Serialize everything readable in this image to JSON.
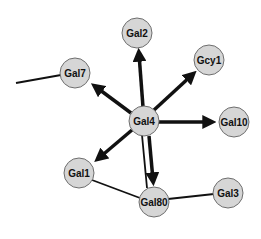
{
  "diagram": {
    "type": "gene-regulatory-network",
    "nodes": [
      {
        "id": "Gal4",
        "label": "Gal4",
        "x": 144,
        "y": 121
      },
      {
        "id": "Gal2",
        "label": "Gal2",
        "x": 137,
        "y": 33
      },
      {
        "id": "Gcy1",
        "label": "Gcy1",
        "x": 209,
        "y": 60
      },
      {
        "id": "Gal7",
        "label": "Gal7",
        "x": 75,
        "y": 73
      },
      {
        "id": "Gal10",
        "label": "Gal10",
        "x": 234,
        "y": 122
      },
      {
        "id": "Gal1",
        "label": "Gal1",
        "x": 79,
        "y": 173
      },
      {
        "id": "Gal80",
        "label": "Gal80",
        "x": 154,
        "y": 202
      },
      {
        "id": "Gal3",
        "label": "Gal3",
        "x": 228,
        "y": 193
      }
    ],
    "directed_edges": [
      {
        "from": "Gal4",
        "to": "Gal2"
      },
      {
        "from": "Gal4",
        "to": "Gcy1"
      },
      {
        "from": "Gal4",
        "to": "Gal7"
      },
      {
        "from": "Gal4",
        "to": "Gal10"
      },
      {
        "from": "Gal4",
        "to": "Gal1"
      },
      {
        "from": "Gal4",
        "to": "Gal80"
      }
    ],
    "undirected_edges": [
      {
        "from": "Gal7",
        "to": "offscreen-left"
      },
      {
        "from": "Gal4",
        "to": "Gal80"
      },
      {
        "from": "Gal1",
        "to": "Gal80"
      },
      {
        "from": "Gal80",
        "to": "Gal3"
      }
    ],
    "colors": {
      "node_fill": "#d6d6d6",
      "node_stroke": "#6e6e6e",
      "edge": "#111111",
      "background": "#ffffff"
    }
  }
}
